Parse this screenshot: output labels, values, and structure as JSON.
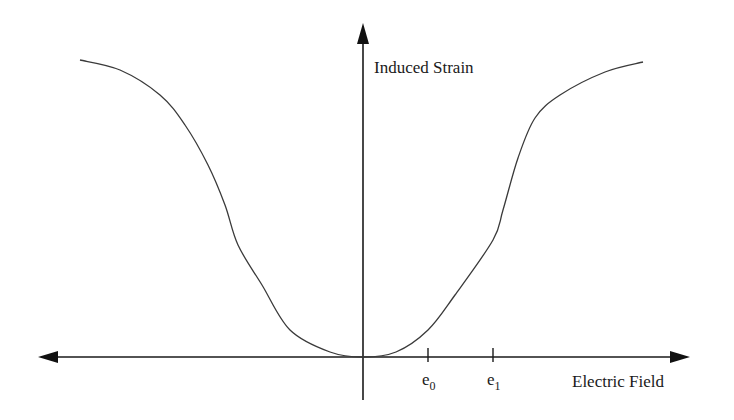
{
  "chart_data": {
    "type": "line",
    "title": "",
    "xlabel": "Electric Field",
    "ylabel": "Induced Strain",
    "grid": false,
    "legend": null,
    "x_ticks": [
      {
        "label": "e",
        "subscript": "0"
      },
      {
        "label": "e",
        "subscript": "1"
      }
    ],
    "series": [
      {
        "name": "Induced strain vs electric field",
        "description": "Symmetric sigmoid-shaped curve, zero at origin, saturating at large |field|",
        "points_px": [
          [
            80,
            60
          ],
          [
            120,
            70
          ],
          [
            160,
            95
          ],
          [
            185,
            125
          ],
          [
            208,
            165
          ],
          [
            225,
            205
          ],
          [
            238,
            245
          ],
          [
            262,
            285
          ],
          [
            290,
            330
          ],
          [
            330,
            352
          ],
          [
            363,
            357
          ],
          [
            396,
            352
          ],
          [
            428,
            330
          ],
          [
            455,
            295
          ],
          [
            493,
            240
          ],
          [
            503,
            210
          ],
          [
            518,
            158
          ],
          [
            535,
            118
          ],
          [
            560,
            95
          ],
          [
            605,
            72
          ],
          [
            643,
            62
          ]
        ]
      }
    ]
  },
  "labels": {
    "y_axis": "Induced Strain",
    "x_axis": "Electric Field",
    "tick_e0_base": "e",
    "tick_e0_sub": "0",
    "tick_e1_base": "e",
    "tick_e1_sub": "1"
  },
  "colors": {
    "axis": "#1a1a1a",
    "curve": "#3a3a3a"
  }
}
